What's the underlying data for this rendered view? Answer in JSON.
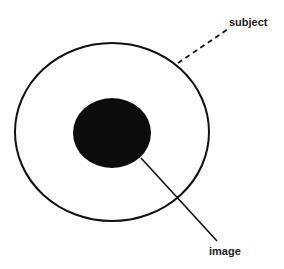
{
  "diagram": {
    "labels": {
      "subject": "subject",
      "image": "image"
    },
    "colors": {
      "background": "#ffffff",
      "stroke": "#111111",
      "fill": "#0d0d0d",
      "text": "#222222"
    }
  }
}
